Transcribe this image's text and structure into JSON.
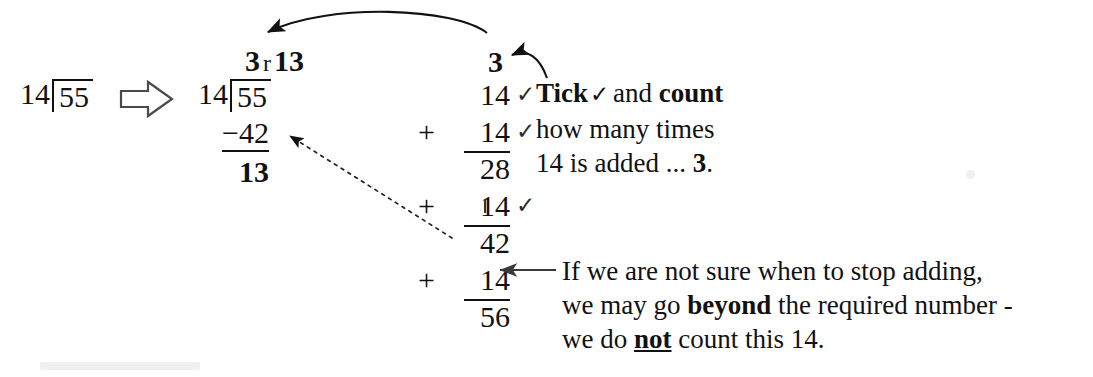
{
  "diagram": {
    "background_color": "#ffffff",
    "ink_color": "#111111"
  },
  "problem": {
    "divisor": "14",
    "dividend": "55",
    "label": "14)55"
  },
  "transform_arrow": {
    "icon": "hollow-right-arrow",
    "direction": "right"
  },
  "long_division": {
    "quotient": "3",
    "remainder_marker": "r",
    "remainder": "13",
    "divisor": "14",
    "dividend": "55",
    "subtrahend": "−42",
    "difference": "13"
  },
  "count_label": {
    "value": "3"
  },
  "addition": {
    "rows": [
      {
        "plus": "",
        "number": "14",
        "ruled": false,
        "tick": "✓"
      },
      {
        "plus": "+",
        "number": "14",
        "ruled": true,
        "tick": "✓"
      },
      {
        "plus": "",
        "number": "28",
        "ruled": false,
        "tick": ""
      },
      {
        "plus": "+",
        "number": "14",
        "ruled": true,
        "tick": "✓"
      },
      {
        "plus": "",
        "number": "42",
        "ruled": false,
        "tick": ""
      },
      {
        "plus": "+",
        "number": "14",
        "ruled": true,
        "tick": ""
      },
      {
        "plus": "",
        "number": "56",
        "ruled": false,
        "tick": ""
      }
    ]
  },
  "note_top": {
    "line1_a": "Tick",
    "line1_tick": "✓",
    "line1_b": "and ",
    "line1_c": "count",
    "line2": "how many times",
    "line3_a": "14 is added ... ",
    "line3_b": "3",
    "line3_c": "."
  },
  "note_bottom": {
    "line1": "If we are not sure when to stop adding,",
    "line2_a": "we may go ",
    "line2_b": "beyond",
    "line2_c": " the required number -",
    "line3_a": "we do ",
    "line3_b": "not",
    "line3_c": " count this 14."
  },
  "arrows": [
    {
      "name": "quotient-curve-arrow",
      "style": "solid-curved",
      "from": "count label 3",
      "to": "quotient 3 r 13"
    },
    {
      "name": "count-hook-arrow",
      "style": "solid-curved-short",
      "from": "Tick and count note",
      "to": "count label 3"
    },
    {
      "name": "subtrahend-dotted-arrow",
      "style": "dotted",
      "from": "sum 42",
      "to": "subtrahend -42"
    },
    {
      "name": "overshoot-arrow",
      "style": "solid-straight",
      "from": "bottom note",
      "to": "addend 14 row"
    }
  ]
}
